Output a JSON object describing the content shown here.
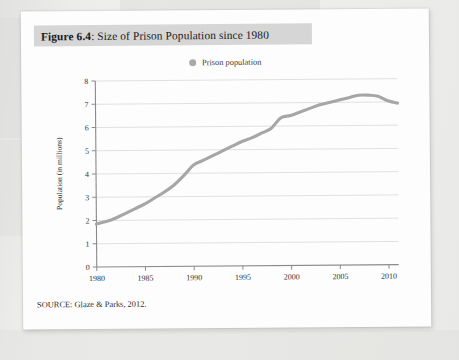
{
  "figure": {
    "label": "Figure 6.4",
    "separator": ": ",
    "title": "Size of Prison Population since 1980",
    "source_note": "SOURCE: Glaze & Parks, 2012."
  },
  "legend": {
    "position": "top-center",
    "marker_icon": "circle-marker-icon",
    "entries": [
      {
        "label": "Prison population",
        "color": "#a9a9a9"
      }
    ]
  },
  "colors": {
    "series_line": "#a6a6a6",
    "axis": "#8a8a8a",
    "gridline": "#d9d9d9",
    "caption_band": "#d6d6d6",
    "paper": "#fdfdfd",
    "background": "#e9e9e7"
  },
  "chart_data": {
    "type": "line",
    "title": "Size of Prison Population since 1980",
    "xlabel": "",
    "ylabel": "Population (in millions)",
    "xlim": [
      1980,
      2011
    ],
    "ylim": [
      0,
      8
    ],
    "xticks": [
      1980,
      1985,
      1990,
      1995,
      2000,
      2005,
      2010
    ],
    "yticks": [
      0,
      1,
      2,
      3,
      4,
      5,
      6,
      7,
      8
    ],
    "xtick_labels": [
      "1980",
      "1985",
      "1990",
      "1995",
      "2000",
      "2005",
      "2010"
    ],
    "ytick_labels": [
      "0",
      "1",
      "2",
      "3",
      "4",
      "5",
      "6",
      "7",
      "8"
    ],
    "grid": "horizontal",
    "legend_position": "top-center",
    "series": [
      {
        "name": "Prison population",
        "color": "#a6a6a6",
        "x": [
          1980,
          1981,
          1982,
          1983,
          1984,
          1985,
          1986,
          1987,
          1988,
          1989,
          1990,
          1991,
          1992,
          1993,
          1994,
          1995,
          1996,
          1997,
          1998,
          1999,
          2000,
          2001,
          2002,
          2003,
          2004,
          2005,
          2006,
          2007,
          2008,
          2009,
          2010,
          2011
        ],
        "values": [
          1.85,
          1.95,
          2.1,
          2.3,
          2.5,
          2.7,
          2.95,
          3.2,
          3.5,
          3.9,
          4.35,
          4.55,
          4.75,
          4.95,
          5.15,
          5.35,
          5.5,
          5.7,
          5.9,
          6.35,
          6.45,
          6.6,
          6.75,
          6.9,
          7.0,
          7.1,
          7.2,
          7.3,
          7.3,
          7.25,
          7.05,
          6.95
        ]
      }
    ]
  }
}
